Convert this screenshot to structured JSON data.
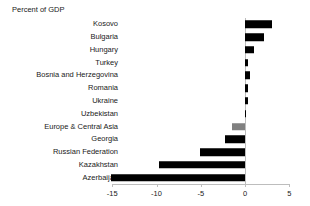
{
  "chart_data": {
    "type": "bar",
    "orientation": "horizontal",
    "title": "Percent of GDP",
    "xlabel": "",
    "ylabel": "",
    "xlim": [
      -15,
      5
    ],
    "xticks": [
      -15,
      -10,
      -5,
      0,
      5
    ],
    "xtick_labels": [
      "-15",
      "-10",
      "-5",
      "0",
      "5"
    ],
    "grid": false,
    "legend": "none",
    "zero_line": 0,
    "categories": [
      "Kosovo",
      "Bulgaria",
      "Hungary",
      "Turkey",
      "Bosnia and Herzegovina",
      "Romania",
      "Ukraine",
      "Uzbekistan",
      "Europe & Central Asia",
      "Georgia",
      "Russian Federation",
      "Kazakhstan",
      "Azerbaijan"
    ],
    "values": [
      3.0,
      2.1,
      1.0,
      0.35,
      0.6,
      0.3,
      0.3,
      0.05,
      -1.5,
      -2.3,
      -5.1,
      -9.7,
      -15.1
    ],
    "bar_colors": [
      "#000000",
      "#000000",
      "#000000",
      "#000000",
      "#000000",
      "#000000",
      "#000000",
      "#000000",
      "#808080",
      "#000000",
      "#000000",
      "#000000",
      "#000000"
    ],
    "highlight_category": "Europe & Central Asia",
    "highlight_color": "#808080",
    "series_color": "#000000"
  }
}
